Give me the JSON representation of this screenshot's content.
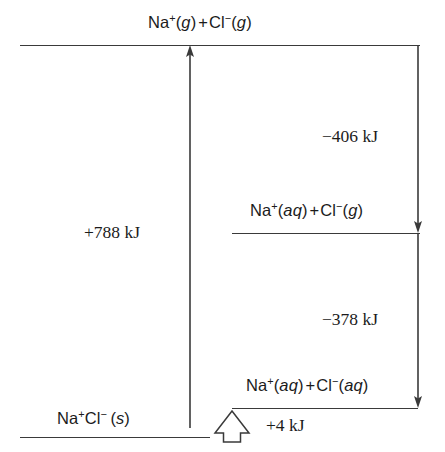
{
  "diagram": {
    "line_color": "#3a3a3a",
    "background": "#ffffff"
  },
  "levels": {
    "top": {
      "name": "gaseous-ions-level",
      "species_html": "Na<sup>+</sup>(<span class=\"st\">g</span>)<span class=\"plus\">+</span>Cl<sup>&#8722;</sup>(<span class=\"st\">g</span>)",
      "species_text": "Na+(g) + Cl-(g)"
    },
    "middle": {
      "name": "sodium-aqueous-chloride-gas-level",
      "species_html": "Na<sup>+</sup>(<span class=\"st\">aq</span>)<span class=\"plus\">+</span>Cl<sup>&#8722;</sup>(<span class=\"st\">g</span>)",
      "species_text": "Na+(aq) + Cl-(g)"
    },
    "lower": {
      "name": "aqueous-ions-level",
      "species_html": "Na<sup>+</sup>(<span class=\"st\">aq</span>)<span class=\"plus\">+</span>Cl<sup>&#8722;</sup>(<span class=\"st\">aq</span>)",
      "species_text": "Na+(aq) + Cl-(aq)"
    },
    "bottom": {
      "name": "solid-sodium-chloride-level",
      "species_html": "Na<sup>+</sup>Cl<sup>&#8722;</sup>&#8201;(<span class=\"st\">s</span>)",
      "species_text": "Na+Cl-(s)"
    }
  },
  "energies": {
    "lattice": {
      "name": "lattice-enthalpy-value",
      "value": "+788 kJ",
      "direction": "up"
    },
    "hydration_sodium": {
      "name": "sodium-hydration-enthalpy-value",
      "value": "−406 kJ",
      "direction": "down"
    },
    "hydration_chloride": {
      "name": "chloride-hydration-enthalpy-value",
      "value": "−378 kJ",
      "direction": "down"
    },
    "solution": {
      "name": "enthalpy-of-solution-value",
      "value": "+4 kJ",
      "direction": "up"
    }
  },
  "icons": {
    "arrow_up": "up-arrow-icon",
    "arrow_down": "down-arrow-icon",
    "hollow_arrow_up": "hollow-up-arrow-icon"
  }
}
